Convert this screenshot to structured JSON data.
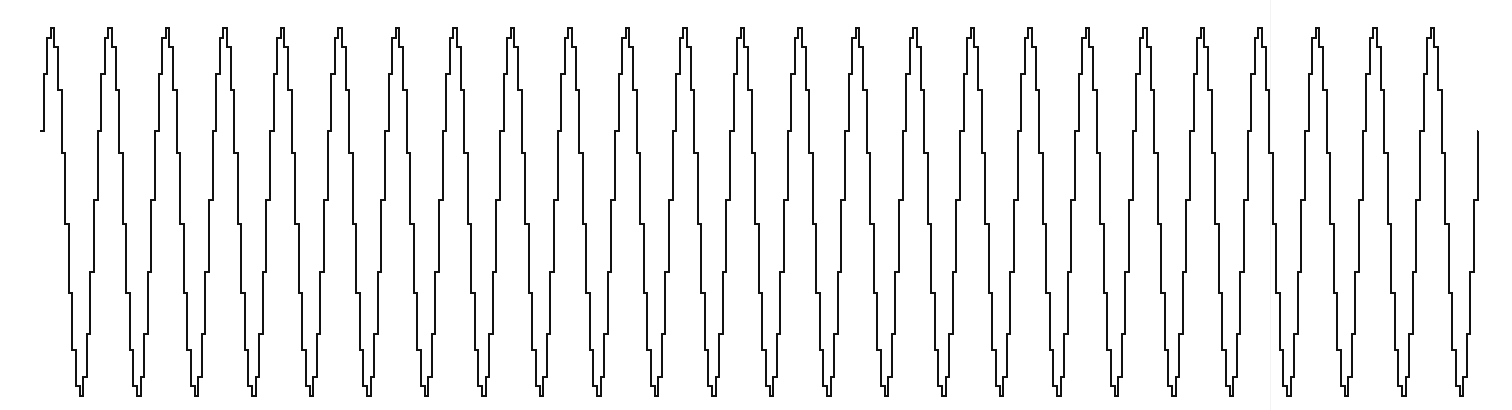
{
  "chart_data": {
    "type": "line",
    "title": "",
    "xlabel": "",
    "ylabel": "",
    "grid": false,
    "legend": null,
    "series": [
      {
        "name": "waveform",
        "color": "#111111",
        "line_width": 2,
        "style": "step",
        "cycles": 24.9,
        "samples_per_cycle": 16,
        "phase_start": "near midline rising (sin ≈ 0.0), ends near midline rising after last trough"
      }
    ],
    "geometry": {
      "x_start_px": 40,
      "x_end_px": 1478,
      "first_peak_x_px": 52,
      "last_peak_x_px": 1432,
      "period_px": 57.5,
      "peak_y_px": 28,
      "trough_y_px": 396,
      "midline_y_px": 212,
      "start_y_px": 215,
      "end_y_px": 196
    },
    "peak_x_positions_px": [
      52,
      110,
      166,
      223,
      280,
      337,
      394,
      451,
      510,
      567,
      624,
      682,
      740,
      797,
      855,
      912,
      970,
      1028,
      1085,
      1143,
      1200,
      1258,
      1315,
      1372,
      1432
    ],
    "ylim": [
      -1,
      1
    ]
  }
}
